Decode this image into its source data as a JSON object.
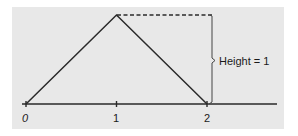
{
  "diagram": {
    "title": "",
    "background_color": "#e8e8e8",
    "line_color": "#2a2a2a",
    "axis": {
      "ticks": [
        {
          "label": "0",
          "value": 0
        },
        {
          "label": "1",
          "value": 1
        },
        {
          "label": "2",
          "value": 2
        }
      ]
    },
    "triangle": {
      "points": [
        [
          0,
          0
        ],
        [
          1,
          1
        ],
        [
          2,
          0
        ]
      ]
    },
    "annotation": {
      "label": "Height = 1"
    }
  }
}
